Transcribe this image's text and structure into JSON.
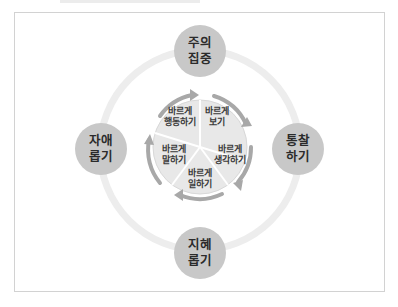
{
  "diagram": {
    "outer_nodes": [
      {
        "id": "top",
        "line1": "주의",
        "line2": "집중"
      },
      {
        "id": "right",
        "line1": "통찰",
        "line2": "하기"
      },
      {
        "id": "bottom",
        "line1": "지혜",
        "line2": "롭기"
      },
      {
        "id": "left",
        "line1": "자애",
        "line2": "롭기"
      }
    ],
    "inner_segments": [
      {
        "id": "see",
        "line1": "바르게",
        "line2": "보기"
      },
      {
        "id": "think",
        "line1": "바르게",
        "line2": "생각하기"
      },
      {
        "id": "work",
        "line1": "바르게",
        "line2": "일하기"
      },
      {
        "id": "speak",
        "line1": "바르게",
        "line2": "말하기"
      },
      {
        "id": "act",
        "line1": "바르게",
        "line2": "행동하기"
      }
    ],
    "colors": {
      "node_fill": "#c8c8c8",
      "ring": "#ececec",
      "inner_fill": "#e6e6e6",
      "arrow": "#a8a8a8",
      "frame": "#d2d2d2"
    }
  }
}
